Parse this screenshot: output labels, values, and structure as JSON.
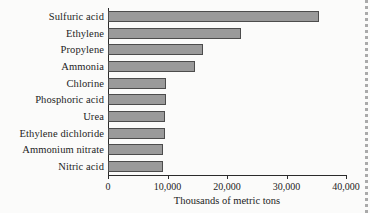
{
  "chart_data": {
    "type": "bar",
    "orientation": "horizontal",
    "title": "",
    "xlabel": "Thousands of metric tons",
    "ylabel": "",
    "categories": [
      "Sulfuric acid",
      "Ethylene",
      "Propylene",
      "Ammonia",
      "Chlorine",
      "Phosphoric acid",
      "Urea",
      "Ethylene dichloride",
      "Ammonium nitrate",
      "Nitric acid"
    ],
    "values": [
      35400,
      22300,
      16000,
      14700,
      9700,
      9700,
      9600,
      9600,
      9300,
      9200
    ],
    "xlim": [
      0,
      40000
    ],
    "xticks": [
      0,
      10000,
      20000,
      30000,
      40000
    ],
    "xtick_labels": [
      "0",
      "10,000",
      "20,000",
      "30,000",
      "40,000"
    ],
    "grid": false,
    "legend": null,
    "bar_fill_color": "#9a9a9a",
    "bar_border_color": "#4c4c4c",
    "axis_color": "#2b2b2b",
    "background_color": "#fbfbfa"
  }
}
